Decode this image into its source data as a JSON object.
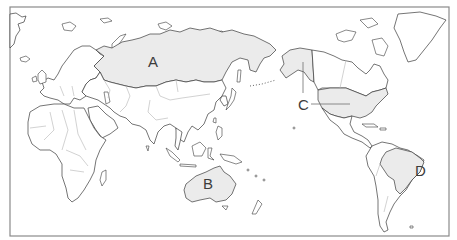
{
  "map": {
    "type": "world-map-pacific-centered",
    "colors": {
      "highlight_fill": "#ebebeb",
      "land_fill": "#ffffff",
      "coastline": "#3a3a3a",
      "country_border": "#b4b4b4",
      "frame": "#8a8a8a",
      "label": "#3c3c3c"
    },
    "regions": [
      {
        "id": "A",
        "label": "A",
        "country": "Russia"
      },
      {
        "id": "B",
        "label": "B",
        "country": "Australia"
      },
      {
        "id": "C",
        "label": "C",
        "country": "United States (incl. Alaska)"
      },
      {
        "id": "D",
        "label": "D",
        "country": "Brazil"
      }
    ]
  }
}
